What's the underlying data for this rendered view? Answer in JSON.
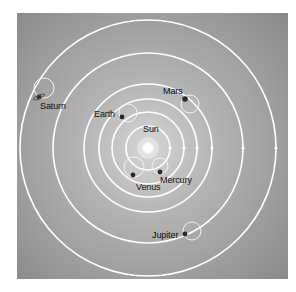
{
  "diagram": {
    "background_color": "#8f8f8f",
    "background_light": "#d4d4d4",
    "orbit_color": "#ffffff",
    "frame": {
      "x": 17,
      "y": 13,
      "w": 271,
      "h": 266
    },
    "sun": {
      "label": "Sun",
      "cx": 148,
      "cy": 148,
      "r": 7,
      "label_x": 143,
      "label_y": 125
    },
    "orbits": [
      {
        "name": "Mercury",
        "r": 22
      },
      {
        "name": "Venus",
        "r": 36
      },
      {
        "name": "Sun",
        "r": 49
      },
      {
        "name": "Mars",
        "r": 64
      },
      {
        "name": "Jupiter",
        "r": 95
      },
      {
        "name": "Saturn",
        "r": 128
      }
    ],
    "planets": [
      {
        "name": "Mercury",
        "label": "Mercury",
        "px": 160,
        "py": 172,
        "epi_cx": 160,
        "epi_cy": 166,
        "epi_r": 8,
        "label_x": 160,
        "label_y": 176
      },
      {
        "name": "Venus",
        "label": "Venus",
        "px": 133,
        "py": 175,
        "epi_cx": 134,
        "epi_cy": 167,
        "epi_r": 10,
        "label_x": 136,
        "label_y": 183
      },
      {
        "name": "Earth",
        "label": "Earth",
        "px": 122,
        "py": 117,
        "epi_cx": 128,
        "epi_cy": 113,
        "epi_r": 9,
        "label_x": 94,
        "label_y": 110
      },
      {
        "name": "Mars",
        "label": "Mars",
        "px": 185,
        "py": 99,
        "epi_cx": 190,
        "epi_cy": 104,
        "epi_r": 9,
        "label_x": 163,
        "label_y": 87
      },
      {
        "name": "Jupiter",
        "label": "Jupiter",
        "px": 185,
        "py": 234,
        "epi_cx": 192,
        "epi_cy": 231,
        "epi_r": 9,
        "label_x": 152,
        "label_y": 231
      },
      {
        "name": "Saturn",
        "label": "Saturn",
        "px": 39,
        "py": 97,
        "epi_cx": 44,
        "epi_cy": 88,
        "epi_r": 10,
        "label_x": 40,
        "label_y": 102
      }
    ],
    "arrows_on_axis": [
      170,
      184,
      197,
      212,
      243,
      276
    ]
  }
}
